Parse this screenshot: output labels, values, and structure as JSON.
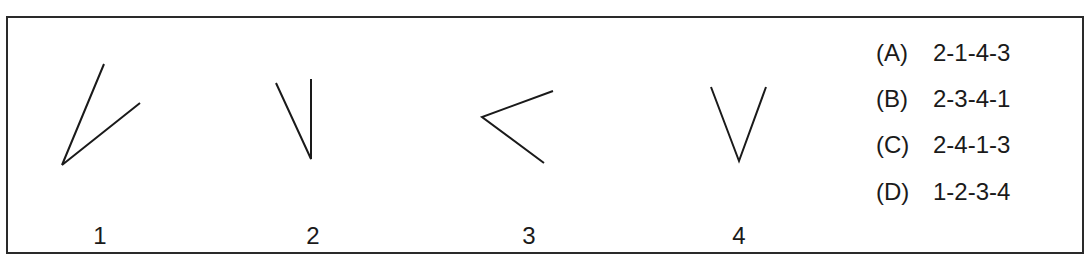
{
  "figures": [
    {
      "label": "1",
      "vertex": [
        62,
        165
      ],
      "ends": [
        [
          104,
          64
        ],
        [
          140,
          103
        ]
      ]
    },
    {
      "label": "2",
      "vertex": [
        311,
        159
      ],
      "ends": [
        [
          276,
          83
        ],
        [
          311,
          79
        ]
      ]
    },
    {
      "label": "3",
      "vertex": [
        482,
        117
      ],
      "ends": [
        [
          553,
          91
        ],
        [
          544,
          163
        ]
      ]
    },
    {
      "label": "4",
      "vertex": [
        739,
        161
      ],
      "ends": [
        [
          711,
          87
        ],
        [
          766,
          87
        ]
      ]
    }
  ],
  "options": [
    {
      "letter": "(A)",
      "sequence": "2-1-4-3"
    },
    {
      "letter": "(B)",
      "sequence": "2-3-4-1"
    },
    {
      "letter": "(C)",
      "sequence": "2-4-1-3"
    },
    {
      "letter": "(D)",
      "sequence": "1-2-3-4"
    }
  ],
  "colors": {
    "line": "#1a1a1a",
    "border": "#2a2a2a"
  }
}
